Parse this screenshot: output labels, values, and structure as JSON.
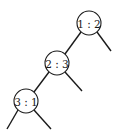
{
  "diagram": {
    "type": "decision-tree",
    "nodes": [
      {
        "id": "n1",
        "label": "1 : 2",
        "cx": 89,
        "cy": 23,
        "r": 12
      },
      {
        "id": "n2",
        "label": "2 : 3",
        "cx": 57,
        "cy": 63,
        "r": 12
      },
      {
        "id": "n3",
        "label": "3 : 1",
        "cx": 26,
        "cy": 101,
        "r": 12
      }
    ],
    "edges": [
      {
        "from": "n1",
        "to": "n2",
        "x1": 81,
        "y1": 32,
        "x2": 65,
        "y2": 54
      },
      {
        "from": "n1",
        "to": "leaf",
        "x1": 97,
        "y1": 32,
        "x2": 111,
        "y2": 51
      },
      {
        "from": "n2",
        "to": "n3",
        "x1": 49,
        "y1": 72,
        "x2": 34,
        "y2": 92
      },
      {
        "from": "n2",
        "to": "leaf",
        "x1": 65,
        "y1": 72,
        "x2": 82,
        "y2": 91
      },
      {
        "from": "n3",
        "to": "leaf",
        "x1": 18,
        "y1": 110,
        "x2": 7,
        "y2": 129
      },
      {
        "from": "n3",
        "to": "leaf",
        "x1": 34,
        "y1": 110,
        "x2": 51,
        "y2": 129
      }
    ]
  }
}
